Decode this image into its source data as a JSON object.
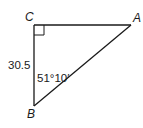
{
  "diagram": {
    "type": "right-triangle",
    "vertices": {
      "A": {
        "label": "A"
      },
      "B": {
        "label": "B"
      },
      "C": {
        "label": "C"
      }
    },
    "right_angle_at": "C",
    "side_CB": {
      "label": "30.5"
    },
    "angle_B": {
      "label": "51°10′"
    },
    "colors": {
      "stroke": "#1a1a1a",
      "background": "#ffffff"
    }
  }
}
